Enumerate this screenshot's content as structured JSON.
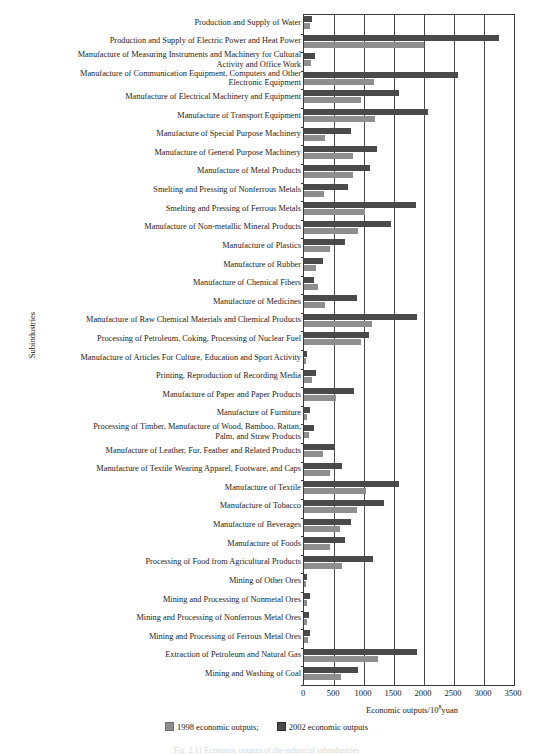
{
  "chart_data": {
    "type": "bar",
    "orientation": "horizontal",
    "title": "",
    "subtitle": "",
    "xlabel": "Economic outputs/10⁸yuan",
    "xlabel_base": "Economic outputs/10",
    "xlabel_exponent": "8",
    "xlabel_suffix": "yuan",
    "ylabel": "Subindustries",
    "xlim": [
      0,
      3500
    ],
    "xticks": [
      0,
      500,
      1000,
      1500,
      2000,
      2500,
      3000,
      3500
    ],
    "xtick_labels": [
      "0",
      "500",
      "1000",
      "1500",
      "2000",
      "2500",
      "3000",
      "3500"
    ],
    "grid": true,
    "grid_axis": "x",
    "legend_position": "bottom",
    "colors": {
      "1998": "#8e8e8e",
      "2002": "#4a4a4a",
      "axis": "#3a3a3a",
      "grid": "#4a4a4a",
      "text": "#1c1c1c"
    },
    "legend": [
      {
        "label": "1998 economic outputs;",
        "color": "#8e8e8e"
      },
      {
        "label": "2002 economic outputs",
        "color": "#4a4a4a"
      }
    ],
    "series": [
      {
        "name": "2002 economic outputs",
        "color": "#4a4a4a",
        "values": [
          140,
          3250,
          180,
          2560,
          1590,
          2070,
          780,
          1210,
          1100,
          730,
          1860,
          1450,
          690,
          310,
          160,
          880,
          1880,
          1090,
          45,
          195,
          830,
          95,
          160,
          500,
          630,
          1580,
          1330,
          790,
          690,
          1150,
          55,
          95,
          80,
          95,
          1880,
          905
        ]
      },
      {
        "name": "1998 economic outputs",
        "color": "#8e8e8e",
        "values": [
          95,
          2000,
          110,
          1170,
          950,
          1180,
          350,
          820,
          810,
          330,
          1010,
          900,
          430,
          200,
          235,
          345,
          1130,
          950,
          30,
          140,
          540,
          55,
          90,
          310,
          430,
          1040,
          880,
          600,
          430,
          630,
          25,
          55,
          45,
          60,
          1230,
          620
        ]
      }
    ],
    "categories": [
      "Production and Supply of Water",
      "Production and Supply of Electric Power and Heat Power",
      "Manufacture of Measuring Instruments and Machinery for Cultural Activity and Office Work",
      "Manufacture of Communication Equipment, Computers and Other Electronic Equipment",
      "Manufacture of Electrical Machinery and Equipment",
      "Manufacture of Transport Equipment",
      "Manufacture of Special Purpose Machinery",
      "Manufacture of General Purpose Machinery",
      "Manufacture of Metal Products",
      "Smelting and Pressing of Nonferrous Metals",
      "Smelting and Pressing of Ferrous Metals",
      "Manufacture of Non-metallic Mineral Products",
      "Manufacture of Plastics",
      "Manufacture of Rubber",
      "Manufacture of Chemical Fibers",
      "Manufacture of Medicines",
      "Manufacture of Raw Chemical Materials and Chemical Products",
      "Processing of Petroleum, Coking, Processing of Nuclear Fuel",
      "Manufacture of Articles For Culture, Education and Sport Activity",
      "Printing, Reproduction of Recording Media",
      "Manufacture of Paper and Paper Products",
      "Manufacture of Furniture",
      "Processing of Timber, Manufacture of Wood, Bamboo, Rattan, Palm, and Straw Products",
      "Manufacture of Leather, Fur, Feather and Related Products",
      "Manufacture of Textile Wearing Apparel, Footware, and Caps",
      "Manufacture of Textile",
      "Manufacture of Tobacco",
      "Manufacture of Beverages",
      "Manufacture of Foods",
      "Processing of Food from Agricultural Products",
      "Mining of Other Ores",
      "Mining and Processing of Nonmetal Ores",
      "Mining and Processing of Nonferrous Metal Ores",
      "Mining and Processing of Ferrous Metal Ores",
      "Extraction of Petroleum and Natural Gas",
      "Mining and Washing of Coal"
    ],
    "category_label_lines": [
      [
        "Production and Supply of Water"
      ],
      [
        "Production and Supply of Electric Power and Heat Power"
      ],
      [
        "Manufacture of Measuring Instruments and Machinery for Cultural",
        "Activity and Office Work"
      ],
      [
        "Manufacture of Communication Equipment, Computers and Other",
        "Electronic Equipment"
      ],
      [
        "Manufacture of Electrical Machinery and Equipment"
      ],
      [
        "Manufacture of Transport Equipment"
      ],
      [
        "Manufacture of Special Purpose Machinery"
      ],
      [
        "Manufacture of General Purpose Machinery"
      ],
      [
        "Manufacture of Metal Products"
      ],
      [
        "Smelting and Pressing of Nonferrous Metals"
      ],
      [
        "Smelting and Pressing of Ferrous Metals"
      ],
      [
        "Manufacture of Non-metallic Mineral Products"
      ],
      [
        "Manufacture of Plastics"
      ],
      [
        "Manufacture of Rubber"
      ],
      [
        "Manufacture of Chemical Fibers"
      ],
      [
        "Manufacture of Medicines"
      ],
      [
        "Manufacture of Raw Chemical Materials and Chemical Products"
      ],
      [
        "Processing of Petroleum, Coking, Processing of Nuclear Fuel"
      ],
      [
        "Manufacture of Articles For Culture, Education and Sport Activity"
      ],
      [
        "Printing, Reproduction of Recording Media"
      ],
      [
        "Manufacture of Paper and Paper Products"
      ],
      [
        "Manufacture of Furniture"
      ],
      [
        "Processing of Timber, Manufacture of Wood, Bamboo, Rattan,",
        "Palm, and Straw Products"
      ],
      [
        "Manufacture of Leather, Fur, Feather and Related Products"
      ],
      [
        "Manufacture of Textile Wearing Apparel, Footware, and Caps"
      ],
      [
        "Manufacture of Textile"
      ],
      [
        "Manufacture of Tobacco"
      ],
      [
        "Manufacture of Beverages"
      ],
      [
        "Manufacture of Foods"
      ],
      [
        "Processing of Food from Agricultural Products"
      ],
      [
        "Mining of Other Ores"
      ],
      [
        "Mining and Processing of Nonmetal Ores"
      ],
      [
        "Mining and Processing of Nonferrous Metal Ores"
      ],
      [
        "Mining and Processing of Ferrous Metal Ores"
      ],
      [
        "Extraction of Petroleum and Natural Gas"
      ],
      [
        "Mining and Washing of Coal"
      ]
    ]
  },
  "caption": "Fig. 2.11  Economic outputs of the industrial subindustries"
}
